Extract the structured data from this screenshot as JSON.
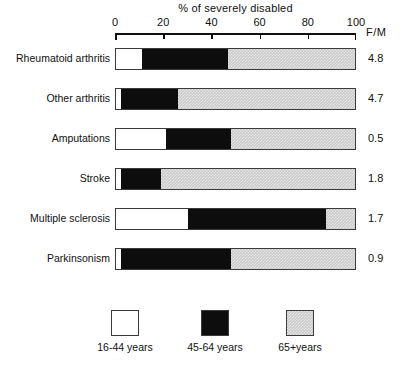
{
  "chart_data": {
    "type": "bar",
    "orientation": "horizontal",
    "stacked": true,
    "title": "% of severely disabled",
    "xlabel": "% of severely disabled",
    "ylabel": "",
    "xlim": [
      0,
      100
    ],
    "xticks": [
      0,
      20,
      40,
      60,
      80,
      100
    ],
    "xticklabels": [
      "0",
      "20",
      "40",
      "60",
      "80",
      "100"
    ],
    "grid": false,
    "legend_position": "bottom",
    "categories": [
      "Rheumatoid arthritis",
      "Other arthritis",
      "Amputations",
      "Stroke",
      "Multiple sclerosis",
      "Parkinsonism"
    ],
    "series": [
      {
        "name": "16-44 years",
        "color": "#ffffff",
        "values": [
          11,
          2,
          21,
          2,
          30,
          2
        ]
      },
      {
        "name": "45-64 years",
        "color": "#0d0d0d",
        "values": [
          36,
          24,
          27,
          17,
          58,
          46
        ]
      },
      {
        "name": "65+ years",
        "color": "#c9c9c9",
        "values": [
          53,
          74,
          52,
          81,
          12,
          52
        ]
      }
    ],
    "extra_column": {
      "header": "F/M",
      "values": [
        "4.8",
        "4.7",
        "0.5",
        "1.8",
        "1.7",
        "0.9"
      ]
    }
  },
  "axis": {
    "title": "% of severely disabled",
    "ticks": [
      {
        "label": "0",
        "value": 0
      },
      {
        "label": "20",
        "value": 20
      },
      {
        "label": "40",
        "value": 40
      },
      {
        "label": "60",
        "value": 60
      },
      {
        "label": "80",
        "value": 80
      },
      {
        "label": "100",
        "value": 100
      }
    ],
    "fm_header": "F/M"
  },
  "rows": [
    {
      "label": "Rheumatoid arthritis",
      "white": 11,
      "black": 36,
      "grey": 53,
      "fm": "4.8"
    },
    {
      "label": "Other arthritis",
      "white": 2,
      "black": 24,
      "grey": 74,
      "fm": "4.7"
    },
    {
      "label": "Amputations",
      "white": 21,
      "black": 27,
      "grey": 52,
      "fm": "0.5"
    },
    {
      "label": "Stroke",
      "white": 2,
      "black": 17,
      "grey": 81,
      "fm": "1.8"
    },
    {
      "label": "Multiple sclerosis",
      "white": 30,
      "black": 58,
      "grey": 12,
      "fm": "1.7"
    },
    {
      "label": "Parkinsonism",
      "white": 2,
      "black": 46,
      "grey": 52,
      "fm": "0.9"
    }
  ],
  "legend": {
    "items": [
      {
        "label": "16-44 years",
        "swatch": "white"
      },
      {
        "label": "45-64 years",
        "swatch": "black"
      },
      {
        "label": "65+years",
        "swatch": "grey"
      }
    ]
  },
  "colors": {
    "white_segment": "#ffffff",
    "black_segment": "#0d0d0d",
    "grey_segment": "#c9c9c9",
    "outline": "#3a3a3a",
    "text": "#111111",
    "background": "#ffffff"
  }
}
